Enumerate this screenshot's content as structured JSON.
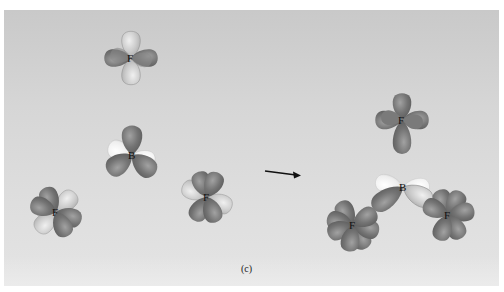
{
  "figure": {
    "caption": "(c)",
    "colors": {
      "background_top": "#c9c9c9",
      "background_bottom": "#e4e4e4",
      "lobe_dark": "#6e6e6e",
      "lobe_dark_highlight": "#9a9a9a",
      "lobe_light": "#c4c4c4",
      "lobe_light_highlight": "#ececec",
      "lobe_white": "#f4f4f4",
      "arrow": "#111111"
    },
    "reactants": {
      "atoms": [
        {
          "id": "F-top",
          "label": "F",
          "x": 131,
          "y": 58
        },
        {
          "id": "B-center",
          "label": "B",
          "x": 132,
          "y": 155
        },
        {
          "id": "F-left",
          "label": "F",
          "x": 56,
          "y": 212
        },
        {
          "id": "F-right",
          "label": "F",
          "x": 207,
          "y": 197
        }
      ]
    },
    "arrow": {
      "x1": 265,
      "y1": 171,
      "x2": 300,
      "y2": 175,
      "direction": "right"
    },
    "product": {
      "name": "BF3",
      "atoms": [
        {
          "id": "F-prod-top",
          "label": "F",
          "x": 402,
          "y": 120
        },
        {
          "id": "B-prod",
          "label": "B",
          "x": 403,
          "y": 187
        },
        {
          "id": "F-prod-left",
          "label": "F",
          "x": 353,
          "y": 225
        },
        {
          "id": "F-prod-right",
          "label": "F",
          "x": 448,
          "y": 215
        }
      ]
    }
  }
}
